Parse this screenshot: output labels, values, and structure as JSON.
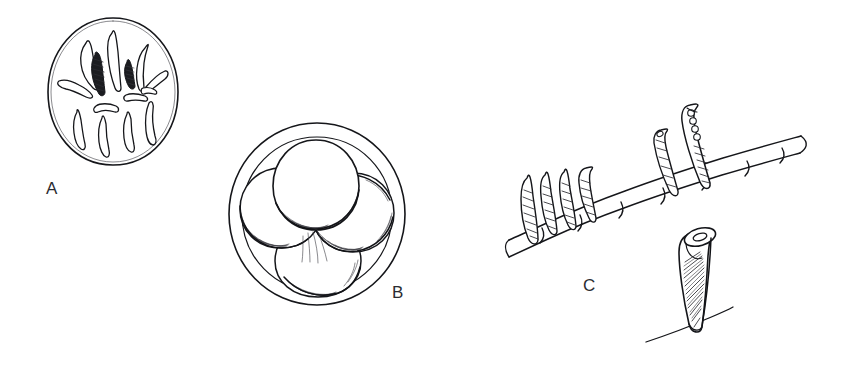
{
  "figure": {
    "title": "",
    "caption": "",
    "background_color": "#ffffff",
    "ink_color": "#15161a",
    "medium": "pen-and-ink line drawing",
    "width": 842,
    "height": 370
  },
  "panels": [
    {
      "id": "A",
      "label": "A",
      "label_position": {
        "x": 46,
        "y": 180
      },
      "description": "Circular outline enclosing numerous radiating club-shaped bodies; two of them rendered with dark cross-hatched shading near the centre-top",
      "outline_shape": "circle",
      "bounds": {
        "x": 47,
        "y": 18,
        "width": 131,
        "height": 147
      },
      "inner_element_count": 12,
      "shaded_element_count": 2
    },
    {
      "id": "B",
      "label": "B",
      "label_position": {
        "x": 392,
        "y": 284
      },
      "description": "Large circular outline with a second concentric inner outline, enclosing four overlapping spheres shaded with fine curved hatching along their lower-left margins",
      "outline_shape": "double circle",
      "bounds": {
        "x": 228,
        "y": 123,
        "width": 177,
        "height": 182
      },
      "sphere_count": 4
    },
    {
      "id": "C",
      "label": "C",
      "label_position": {
        "x": 583,
        "y": 277
      },
      "description": "Segmented filament running diagonally with flask-shaped sporangia attached along its upper side; one erect sporangium contains a row of four small round spores. Below right, an isolated enlarged sporangium stands on a ground line, its interior filled with diagonal hatching and its open mouth shown in perspective.",
      "filament_segment_count": 8,
      "attached_sporangia_count": 6,
      "spore_row_count": 4,
      "isolated_sporangium": true
    }
  ]
}
